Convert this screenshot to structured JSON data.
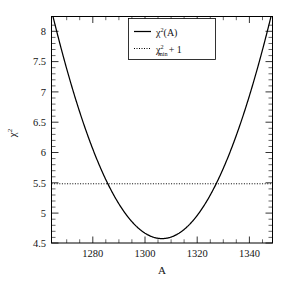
{
  "chart_data": {
    "type": "line",
    "title": "",
    "xlabel": "A",
    "ylabel": "χ²",
    "xlim": [
      1262,
      1350
    ],
    "ylim": [
      4.17,
      8.3
    ],
    "xticks": [
      1280,
      1300,
      1320,
      1340
    ],
    "xtick_labels": [
      "1280",
      "1300",
      "1320",
      "1340"
    ],
    "yticks": [
      4.5,
      5,
      5.5,
      6,
      6.5,
      7,
      7.5,
      8
    ],
    "ytick_labels": [
      "4.5",
      "5",
      "5.5",
      "6",
      "6.5",
      "7",
      "7.5",
      "8"
    ],
    "grid": false,
    "legend_position": "top-center",
    "minor_ticks": true,
    "series": [
      {
        "name": "chi2_of_A",
        "label": "χ²(A)",
        "style": "solid",
        "color": "#000000",
        "description": "Parabolic chi-square curve with minimum 4.25 at A = 1306",
        "vertex_x": 1306,
        "vertex_y": 4.25,
        "curvature": 0.00215,
        "x": [
          1262,
          1266,
          1270,
          1274,
          1278,
          1282,
          1286,
          1290,
          1294,
          1298,
          1302,
          1306,
          1310,
          1314,
          1318,
          1322,
          1326,
          1330,
          1334,
          1338,
          1342,
          1346,
          1350
        ],
        "y": [
          8.41,
          8.06,
          7.73,
          7.42,
          7.14,
          6.88,
          6.64,
          6.43,
          6.24,
          6.08,
          5.94,
          4.25,
          4.29,
          4.39,
          4.56,
          4.8,
          5.11,
          5.49,
          5.94,
          6.45,
          7.04,
          7.69,
          8.41
        ]
      },
      {
        "name": "chi2_min_plus_one",
        "label": "χ²min + 1",
        "style": "dotted",
        "color": "#000000",
        "description": "Horizontal reference line at chi2_min + 1",
        "value": 5.25,
        "crossings": [
          1285.4,
          1326.6
        ]
      }
    ],
    "legend": [
      {
        "style": "solid",
        "base": "χ",
        "sup": "2",
        "arg": "(A)",
        "sub": "",
        "suffix": ""
      },
      {
        "style": "dotted",
        "base": "χ",
        "sup": "2",
        "arg": "",
        "sub": "min",
        "suffix": "+ 1"
      }
    ]
  },
  "axes": {
    "x_title": "A",
    "y_base": "χ",
    "y_sup": "2"
  }
}
